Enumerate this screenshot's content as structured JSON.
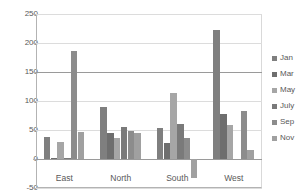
{
  "chart_data": {
    "type": "bar",
    "title": "",
    "xlabel": "",
    "ylabel": "",
    "categories": [
      "East",
      "North",
      "South",
      "West"
    ],
    "ylim": [
      -50,
      250
    ],
    "yticks": [
      250,
      200,
      150,
      100,
      50,
      0,
      -50
    ],
    "ytick_labels": [
      "250",
      "200",
      "150",
      "100",
      "50",
      "0",
      "-50"
    ],
    "grid": true,
    "legend_position": "right",
    "series": [
      {
        "name": "Jan",
        "color": "#7f7f7f",
        "values": [
          38,
          90,
          54,
          223
        ]
      },
      {
        "name": "Mar",
        "color": "#6e6e6e",
        "values": [
          1,
          44,
          27,
          78
        ]
      },
      {
        "name": "May",
        "color": "#a6a6a6",
        "values": [
          29,
          37,
          113,
          58
        ]
      },
      {
        "name": "July",
        "color": "#7a7a7a",
        "values": [
          1,
          55,
          61,
          0
        ]
      },
      {
        "name": "Sep",
        "color": "#8c8c8c",
        "values": [
          186,
          48,
          37,
          83
        ]
      },
      {
        "name": "Nov",
        "color": "#a0a0a0",
        "values": [
          46,
          45,
          -33,
          15
        ]
      }
    ]
  },
  "axis": {
    "tick_250": "250",
    "tick_200": "200",
    "tick_150": "150",
    "tick_100": "100",
    "tick_50": "50",
    "tick_0": "0",
    "tick_neg50": "-50"
  },
  "legend": {
    "items": [
      {
        "label": "Jan"
      },
      {
        "label": "Mar"
      },
      {
        "label": "May"
      },
      {
        "label": "July"
      },
      {
        "label": "Sep"
      },
      {
        "label": "Nov"
      }
    ]
  },
  "colors": {
    "gridline": "#dcdcdc",
    "axis": "#9a9a9a",
    "text": "#595959",
    "background": "#ffffff"
  }
}
